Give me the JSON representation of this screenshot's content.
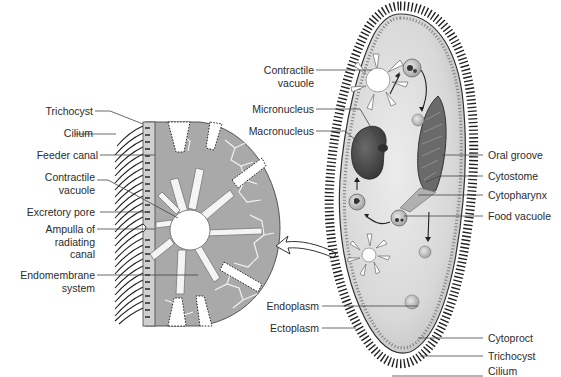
{
  "diagram": {
    "enlarged_view": {
      "labels": [
        {
          "id": "trichocyst",
          "text": "Trichocyst"
        },
        {
          "id": "cilium",
          "text": "Cilium"
        },
        {
          "id": "feeder-canal",
          "text": "Feeder canal"
        },
        {
          "id": "contractile-vacuole",
          "line1": "Contractile",
          "line2": "vacuole"
        },
        {
          "id": "excretory-pore",
          "text": "Excretory pore"
        },
        {
          "id": "ampulla",
          "line1": "Ampulla of",
          "line2": "radiating",
          "line3": "canal"
        },
        {
          "id": "endomembrane",
          "line1": "Endomembrane",
          "line2": "system"
        }
      ]
    },
    "whole_cell": {
      "left_labels": [
        {
          "id": "contractile-vacuole",
          "line1": "Contractile",
          "line2": "vacuole"
        },
        {
          "id": "micronucleus",
          "text": "Micronucleus"
        },
        {
          "id": "macronucleus",
          "text": "Macronucleus"
        },
        {
          "id": "endoplasm",
          "text": "Endoplasm"
        },
        {
          "id": "ectoplasm",
          "text": "Ectoplasm"
        }
      ],
      "right_labels": [
        {
          "id": "oral-groove",
          "text": "Oral groove"
        },
        {
          "id": "cytostome",
          "text": "Cytostome"
        },
        {
          "id": "cytopharynx",
          "text": "Cytopharynx"
        },
        {
          "id": "food-vacuole",
          "text": "Food vacuole"
        },
        {
          "id": "cytoproct",
          "text": "Cytoproct"
        },
        {
          "id": "trichocyst",
          "text": "Trichocyst"
        },
        {
          "id": "cilium",
          "text": "Cilium"
        }
      ]
    },
    "colors": {
      "cytoplasm_light": "#e2e2e2",
      "cytoplasm_dark": "#c4c4c4",
      "enlarged_fill": "#a8a8a8",
      "nucleus": "#4a4a4a",
      "line": "#3a3a3a",
      "cilia": "#222222"
    }
  }
}
